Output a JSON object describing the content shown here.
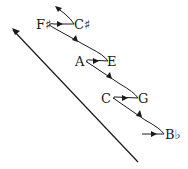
{
  "diagram": {
    "type": "line-of-fifths-spiral",
    "notes": [
      {
        "id": "fsharp",
        "label": "F♯",
        "x": 43,
        "y": 28
      },
      {
        "id": "csharp",
        "label": "C♯",
        "x": 81,
        "y": 28
      },
      {
        "id": "a",
        "label": "A",
        "x": 79,
        "y": 66
      },
      {
        "id": "e",
        "label": "E",
        "x": 112,
        "y": 66
      },
      {
        "id": "c",
        "label": "C",
        "x": 105,
        "y": 103
      },
      {
        "id": "g",
        "label": "G",
        "x": 142,
        "y": 103
      },
      {
        "id": "bflat",
        "label": "B♭",
        "x": 167,
        "y": 139
      }
    ],
    "edges": [
      {
        "from": "start",
        "to": "bflat",
        "direction": "right"
      },
      {
        "from": "bflat",
        "to": "c",
        "direction": "up-left"
      },
      {
        "from": "c",
        "to": "g",
        "direction": "right"
      },
      {
        "from": "g",
        "to": "a",
        "direction": "up-left"
      },
      {
        "from": "a",
        "to": "e",
        "direction": "right"
      },
      {
        "from": "e",
        "to": "fsharp",
        "direction": "up-left"
      },
      {
        "from": "fsharp",
        "to": "csharp",
        "direction": "right"
      },
      {
        "from": "csharp",
        "to": "continue",
        "direction": "up-left"
      }
    ],
    "main_arrow": {
      "direction": "up-left"
    },
    "colors": {
      "stroke": "#1a1a1a",
      "background": "#ffffff"
    }
  }
}
